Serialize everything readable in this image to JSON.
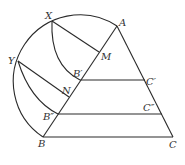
{
  "diagram": {
    "type": "geometric construction",
    "points": {
      "A": {
        "label": "A",
        "x": 117,
        "y": 26
      },
      "B": {
        "label": "B",
        "x": 43,
        "y": 137
      },
      "C": {
        "label": "C",
        "x": 173,
        "y": 137
      },
      "X": {
        "label": "X",
        "x": 52,
        "y": 21
      },
      "Y": {
        "label": "Y",
        "x": 18,
        "y": 61
      },
      "M": {
        "label": "M",
        "x": 99,
        "y": 52
      },
      "N": {
        "label": "N",
        "x": 69,
        "y": 97
      },
      "B1": {
        "label": "B′",
        "x": 80,
        "y": 80
      },
      "C1": {
        "label": "C′",
        "x": 145,
        "y": 80
      },
      "B2": {
        "label": "B″",
        "x": 58,
        "y": 114
      },
      "C2": {
        "label": "C″",
        "x": 162,
        "y": 114
      }
    },
    "segments": [
      "AB",
      "AC",
      "BC",
      "B′C′",
      "B″C″",
      "XM",
      "YN"
    ],
    "arcs": [
      "semicircle on AB through X and Y",
      "arc X to B′ centered at A",
      "arc Y to B″ centered at A"
    ]
  }
}
